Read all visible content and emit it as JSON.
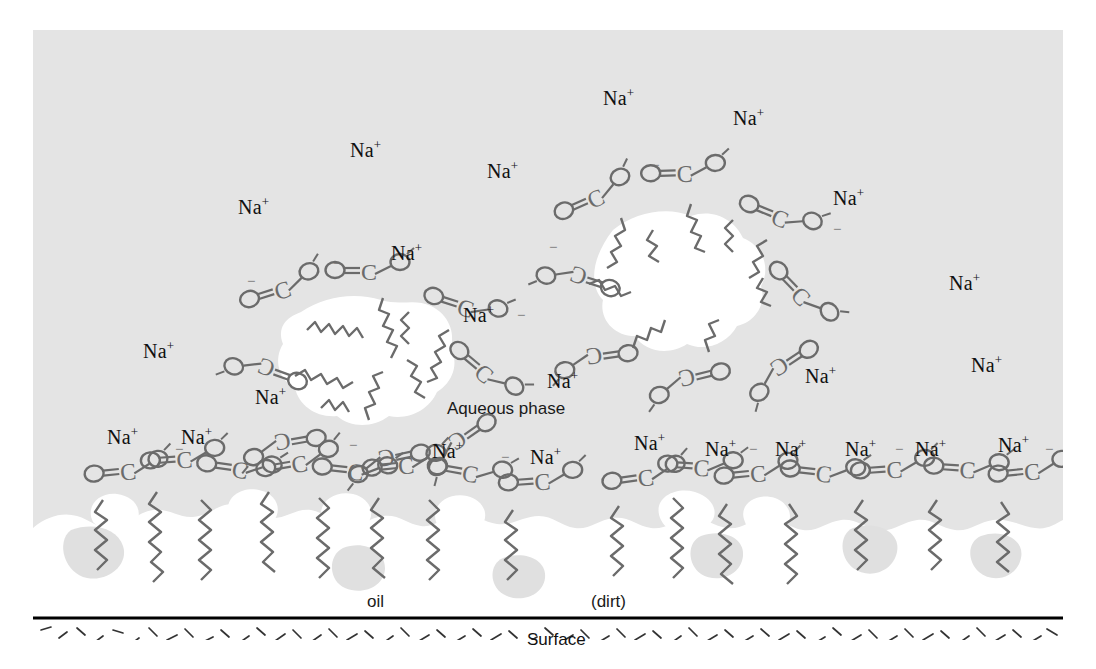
{
  "figure": {
    "title_alt": "Soap micelle and surfactant action diagram",
    "colors": {
      "aqueous_fill": "#e4e4e4",
      "oil_fill": "#ffffff",
      "page_background": "#ffffff",
      "stroke": "#6b6b6b",
      "text": "#111111",
      "surface_line": "#000000",
      "surface_hatch": "#333333"
    }
  },
  "labels": {
    "aqueous_phase": "Aqueous phase",
    "oil": "oil",
    "dirt": "(dirt)",
    "surface": "Surface"
  },
  "ion": {
    "symbol": "Na",
    "charge": "+"
  },
  "chemistry": {
    "head_group": "carboxylate",
    "atoms": [
      "O",
      "C",
      "O"
    ],
    "carbonyl_oxygen": "O",
    "anionic_oxygen": "O",
    "charge_superscript": "-",
    "carbon": "C",
    "tail": "hydrocarbon-zigzag"
  },
  "sodium_ions": [
    {
      "id": 1,
      "x": 570,
      "y": 58
    },
    {
      "id": 2,
      "x": 700,
      "y": 78
    },
    {
      "id": 3,
      "x": 317,
      "y": 110
    },
    {
      "id": 4,
      "x": 454,
      "y": 131
    },
    {
      "id": 5,
      "x": 205,
      "y": 167
    },
    {
      "id": 6,
      "x": 800,
      "y": 158
    },
    {
      "id": 7,
      "x": 358,
      "y": 213
    },
    {
      "id": 8,
      "x": 916,
      "y": 243
    },
    {
      "id": 9,
      "x": 430,
      "y": 275
    },
    {
      "id": 10,
      "x": 110,
      "y": 311
    },
    {
      "id": 11,
      "x": 514,
      "y": 341
    },
    {
      "id": 12,
      "x": 772,
      "y": 336
    },
    {
      "id": 13,
      "x": 938,
      "y": 325
    },
    {
      "id": 14,
      "x": 222,
      "y": 357
    },
    {
      "id": 15,
      "x": 74,
      "y": 397
    },
    {
      "id": 16,
      "x": 148,
      "y": 397
    },
    {
      "id": 17,
      "x": 399,
      "y": 411
    },
    {
      "id": 18,
      "x": 497,
      "y": 417
    },
    {
      "id": 19,
      "x": 601,
      "y": 403
    },
    {
      "id": 20,
      "x": 672,
      "y": 409
    },
    {
      "id": 21,
      "x": 742,
      "y": 409
    },
    {
      "id": 22,
      "x": 812,
      "y": 409
    },
    {
      "id": 23,
      "x": 882,
      "y": 409
    },
    {
      "id": 24,
      "x": 965,
      "y": 405
    }
  ],
  "micelles": [
    {
      "id": "micelle-left",
      "cx": 320,
      "cy": 345,
      "surfactant_count": 8
    },
    {
      "id": "micelle-right",
      "cx": 640,
      "cy": 230,
      "surfactant_count": 9
    }
  ],
  "oil_layer": {
    "id": "oil-layer",
    "description": "continuous oil/dirt film adhering to the surface",
    "surfactant_count": 14
  },
  "surface_band": {
    "id": "solid-surface",
    "top_y": 588,
    "height": 52,
    "pattern": "random-dash-hatch"
  }
}
